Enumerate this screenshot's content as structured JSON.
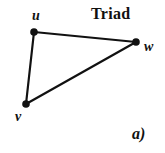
{
  "figure": {
    "title": "Triad",
    "panel_label": "a)",
    "background_color": "#ffffff",
    "stroke_color": "#111111",
    "vertex_fill_color": "#111111",
    "width": 165,
    "height": 153
  },
  "graph": {
    "nodes": [
      {
        "id": "u",
        "label": "u",
        "x": 34,
        "y": 32,
        "label_x": 32,
        "label_y": 9
      },
      {
        "id": "w",
        "label": "w",
        "x": 136,
        "y": 42,
        "label_x": 144,
        "label_y": 40
      },
      {
        "id": "v",
        "label": "v",
        "x": 26,
        "y": 104,
        "label_x": 15,
        "label_y": 110
      }
    ],
    "edges": [
      {
        "from": "u",
        "to": "w"
      },
      {
        "from": "u",
        "to": "v"
      },
      {
        "from": "v",
        "to": "w"
      }
    ],
    "node_radius": 3.6,
    "edge_width": 2.2
  }
}
